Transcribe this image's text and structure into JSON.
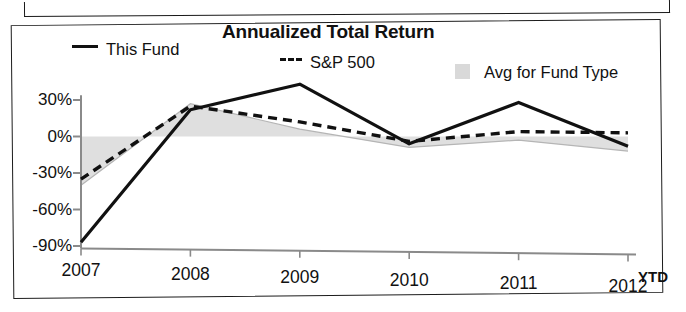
{
  "chart_data": {
    "type": "line",
    "title": "Annualized Total Return",
    "xlabel": "",
    "ylabel": "",
    "x": [
      "2007",
      "2008",
      "2009",
      "2010",
      "2011",
      "2012"
    ],
    "categories": [
      "2007",
      "2008",
      "2009",
      "2010",
      "2011",
      "2012"
    ],
    "ytd_note": "YTD",
    "ylim": [
      -100,
      45
    ],
    "yticks": [
      30,
      0,
      -30,
      -60,
      -90
    ],
    "ytick_labels": [
      "30%",
      "0%",
      "-30%",
      "-60%",
      "-90%"
    ],
    "grid": false,
    "legend_position": "top",
    "series": [
      {
        "name": "This Fund",
        "style": "solid",
        "color": "#111111",
        "values": [
          -87,
          22,
          43,
          -6,
          28,
          -8
        ]
      },
      {
        "name": "S&P 500",
        "style": "dashed",
        "color": "#111111",
        "values": [
          -35,
          25,
          12,
          -4,
          4,
          3
        ]
      },
      {
        "name": "Avg for Fund Type",
        "style": "area",
        "color": "#d9d9d9",
        "values": [
          -40,
          27,
          6,
          -9,
          -3,
          -12
        ]
      }
    ]
  },
  "chart": {
    "title": "Annualized Total Return",
    "legend": [
      {
        "label": "This Fund",
        "swatch": "solid-line-swatch"
      },
      {
        "label": "S&P 500",
        "swatch": "dashed-line-swatch"
      },
      {
        "label": "Avg for Fund Type",
        "swatch": "gray-area-swatch"
      }
    ],
    "y_axis": {
      "labels": [
        "30%",
        "0%",
        "-30%",
        "-60%",
        "-90%"
      ]
    },
    "x_axis": {
      "labels": [
        "2007",
        "2008",
        "2009",
        "2010",
        "2011",
        "2012"
      ],
      "suffix": "YTD"
    }
  }
}
